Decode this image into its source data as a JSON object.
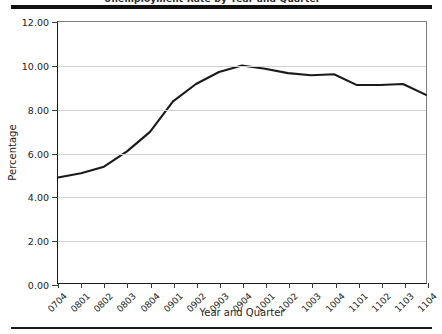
{
  "title": {
    "text": "Unemployment Rate by Year and Quarter",
    "visible": "clipped"
  },
  "axis_title_x": "Year and Quarter",
  "axis_title_y": "Percentage",
  "colors": {
    "line": "#1a1a1a",
    "grid": "#d2d2d2",
    "axis": "#1a1a1a",
    "rule": "#111111",
    "background": "#ffffff"
  },
  "chart_data": {
    "type": "line",
    "title": "Unemployment Rate by Year and Quarter",
    "xlabel": "Year and Quarter",
    "ylabel": "Percentage",
    "categories": [
      "0704",
      "0801",
      "0802",
      "0803",
      "0804",
      "0901",
      "0902",
      "0903",
      "0904",
      "1001",
      "1002",
      "1003",
      "1004",
      "1101",
      "1102",
      "1103",
      "1104"
    ],
    "values": [
      4.85,
      5.05,
      5.35,
      6.05,
      6.95,
      8.35,
      9.15,
      9.7,
      10.0,
      9.85,
      9.65,
      9.55,
      9.6,
      9.1,
      9.1,
      9.15,
      8.65
    ],
    "ylim": [
      0.0,
      12.0
    ],
    "ytick_values": [
      0.0,
      2.0,
      4.0,
      6.0,
      8.0,
      10.0,
      12.0
    ],
    "ytick_labels": [
      "0.00",
      "2.00",
      "4.00",
      "6.00",
      "8.00",
      "10.00",
      "12.00"
    ],
    "grid": "horizontal",
    "legend": "none",
    "series": [
      {
        "name": "Percentage",
        "values": [
          4.85,
          5.05,
          5.35,
          6.05,
          6.95,
          8.35,
          9.15,
          9.7,
          10.0,
          9.85,
          9.65,
          9.55,
          9.6,
          9.1,
          9.1,
          9.15,
          8.65
        ]
      }
    ]
  }
}
